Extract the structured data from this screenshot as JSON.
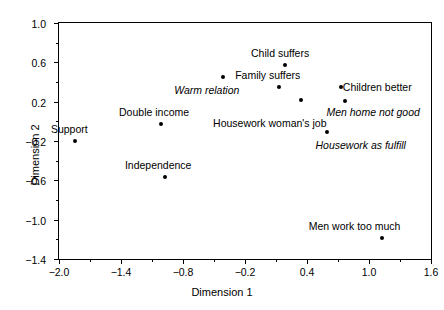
{
  "chart_data": {
    "type": "scatter",
    "title": "",
    "xlabel": "Dimension 1",
    "ylabel": "Dimension 2",
    "xlim": [
      -2.0,
      1.6
    ],
    "ylim": [
      -1.4,
      1.0
    ],
    "grid": false,
    "legend": "none",
    "xticks": [
      "-2.0",
      "-1.4",
      "-0.8",
      "-0.2",
      "0.4",
      "1.0",
      "1.6"
    ],
    "xtick_values": [
      -2.0,
      -1.4,
      -0.8,
      -0.2,
      0.4,
      1.0,
      1.6
    ],
    "xminor_values": [
      -1.7,
      -1.1,
      -0.5,
      0.1,
      0.7,
      1.3
    ],
    "yticks": [
      "1.0",
      "0.6",
      "0.2",
      "-0.2",
      "-0.6",
      "-1.0",
      "-1.4"
    ],
    "ytick_values": [
      1.0,
      0.6,
      0.2,
      -0.2,
      -0.6,
      -1.0,
      -1.4
    ],
    "yminor_values": [
      0.8,
      0.4,
      0.0,
      -0.4,
      -0.8,
      -1.2
    ],
    "marker_color": "#000000",
    "points": [
      {
        "label": "Support",
        "x": -1.85,
        "y": -0.2,
        "style": "normal",
        "lx": -1.9,
        "ly": -0.08,
        "anchor": "center"
      },
      {
        "label": "Double income",
        "x": -1.01,
        "y": -0.03,
        "style": "normal",
        "lx": -1.08,
        "ly": 0.1,
        "anchor": "center"
      },
      {
        "label": "Independence",
        "x": -0.97,
        "y": -0.57,
        "style": "normal",
        "lx": -1.04,
        "ly": -0.44,
        "anchor": "center"
      },
      {
        "label": "Warm relation",
        "x": -0.41,
        "y": 0.45,
        "style": "italic",
        "lx": -0.57,
        "ly": 0.32,
        "anchor": "center"
      },
      {
        "label": "Child suffers",
        "x": 0.19,
        "y": 0.57,
        "style": "normal",
        "lx": 0.14,
        "ly": 0.7,
        "anchor": "center"
      },
      {
        "label": "Family suffers",
        "x": 0.13,
        "y": 0.35,
        "style": "normal",
        "lx": 0.02,
        "ly": 0.47,
        "anchor": "center"
      },
      {
        "label": "Housework woman's job",
        "x": 0.34,
        "y": 0.22,
        "style": "normal",
        "lx": 0.04,
        "ly": -0.02,
        "anchor": "center"
      },
      {
        "label": "Children better",
        "x": 0.73,
        "y": 0.35,
        "style": "normal",
        "lx": 1.08,
        "ly": 0.35,
        "anchor": "center"
      },
      {
        "label": "Men home not good",
        "x": 0.77,
        "y": 0.21,
        "style": "italic",
        "lx": 1.04,
        "ly": 0.09,
        "anchor": "center"
      },
      {
        "label": "Housework as fulfill",
        "x": 0.59,
        "y": -0.11,
        "style": "italic",
        "lx": 0.92,
        "ly": -0.24,
        "anchor": "center"
      },
      {
        "label": "Men work too much",
        "x": 1.13,
        "y": -1.19,
        "style": "normal",
        "lx": 0.86,
        "ly": -1.06,
        "anchor": "center"
      }
    ]
  }
}
